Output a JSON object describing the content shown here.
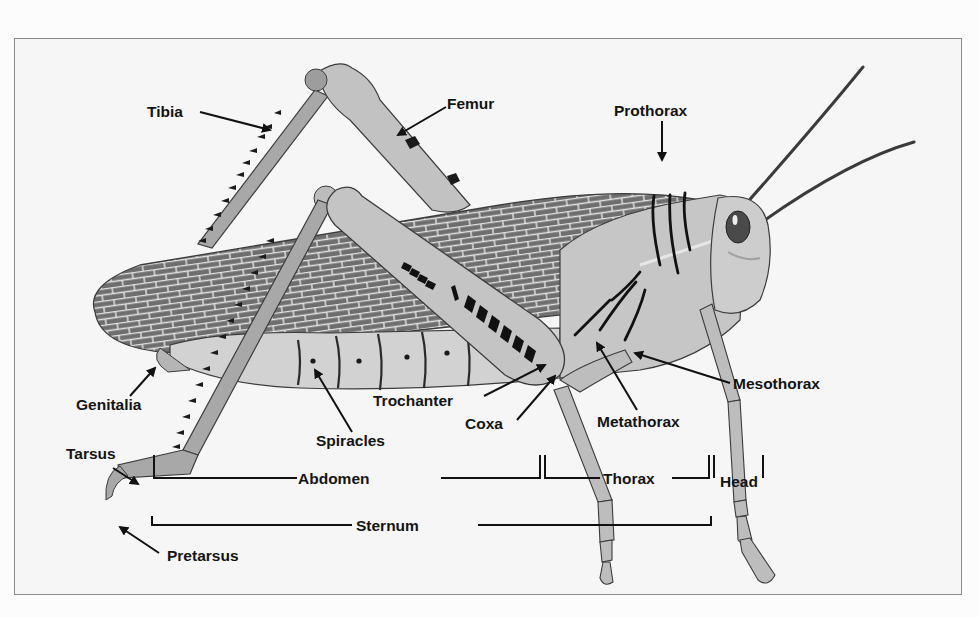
{
  "figure": {
    "colors": {
      "frame_bg": "#f6f6f6",
      "frame_border": "#8a8a8a",
      "body_light": "#c9c9c9",
      "body_mid": "#a9a9a9",
      "wing_dark": "#6e6e6e",
      "wing_veins": "#e8e8e8",
      "outline": "#3a3a3a",
      "label_text": "#141414"
    }
  },
  "labels": {
    "tibia": "Tibia",
    "femur": "Femur",
    "prothorax": "Prothorax",
    "mesothorax": "Mesothorax",
    "metathorax": "Metathorax",
    "trochanter": "Trochanter",
    "coxa": "Coxa",
    "spiracles": "Spiracles",
    "genitalia": "Genitalia",
    "tarsus": "Tarsus",
    "pretarsus": "Pretarsus"
  },
  "brackets": {
    "abdomen": "Abdomen",
    "thorax": "Thorax",
    "head": "Head",
    "sternum": "Sternum"
  },
  "caption": ""
}
